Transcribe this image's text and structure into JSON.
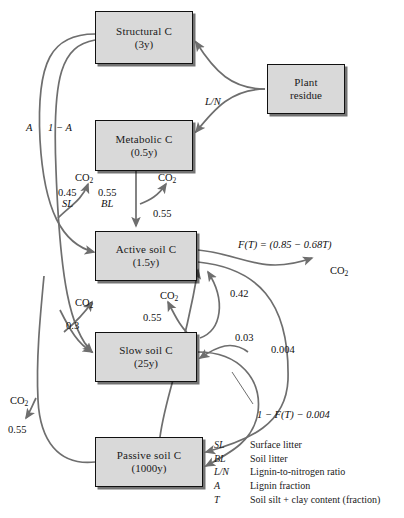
{
  "figure": {
    "type": "flow-diagram",
    "boxes": [
      {
        "id": "structural",
        "name": "Structural C",
        "turnover": "(3y)",
        "x": 95,
        "y": 11,
        "w": 98,
        "h": 53
      },
      {
        "id": "plant",
        "name": "Plant",
        "turnover": "residue",
        "x": 267,
        "y": 64,
        "w": 78,
        "h": 50
      },
      {
        "id": "metabolic",
        "name": "Metabolic C",
        "turnover": "(0.5y)",
        "x": 95,
        "y": 120,
        "w": 98,
        "h": 51
      },
      {
        "id": "active",
        "name": "Active soil C",
        "turnover": "(1.5y)",
        "x": 95,
        "y": 231,
        "w": 102,
        "h": 50
      },
      {
        "id": "slow",
        "name": "Slow soil C",
        "turnover": "(25y)",
        "x": 95,
        "y": 332,
        "w": 102,
        "h": 50
      },
      {
        "id": "passive",
        "name": "Passive soil C",
        "turnover": "(1000y)",
        "x": 95,
        "y": 437,
        "w": 108,
        "h": 50
      }
    ],
    "flow_labels": [
      {
        "id": "ln",
        "text": "L/N",
        "x": 205,
        "y": 96,
        "italic": true
      },
      {
        "id": "a-fraction",
        "text": "A",
        "x": 26,
        "y": 122,
        "italic": true
      },
      {
        "id": "one-minus-a",
        "text": "1 − A",
        "x": 48,
        "y": 122,
        "italic": true
      },
      {
        "id": "co2-structural",
        "text": "CO2",
        "x": 75,
        "y": 172,
        "italic": false
      },
      {
        "id": "frac-045",
        "text": "0.45",
        "x": 58,
        "y": 187,
        "italic": false
      },
      {
        "id": "frac-055-bl",
        "text": "0.55",
        "x": 98,
        "y": 187,
        "italic": false
      },
      {
        "id": "sl",
        "text": "SL",
        "x": 62,
        "y": 198,
        "italic": true
      },
      {
        "id": "bl",
        "text": "BL",
        "x": 101,
        "y": 198,
        "italic": true
      },
      {
        "id": "co2-metabolic",
        "text": "CO2",
        "x": 158,
        "y": 172,
        "italic": false
      },
      {
        "id": "frac-055-met",
        "text": "0.55",
        "x": 153,
        "y": 208,
        "italic": false
      },
      {
        "id": "ft-equation",
        "text": "F(T) = (0.85 − 0.68T)",
        "x": 238,
        "y": 239,
        "italic": true
      },
      {
        "id": "co2-active",
        "text": "CO2",
        "x": 330,
        "y": 265,
        "italic": false
      },
      {
        "id": "frac-042",
        "text": "0.42",
        "x": 230,
        "y": 288,
        "italic": false
      },
      {
        "id": "co2-slow-left",
        "text": "CO2",
        "x": 75,
        "y": 297,
        "italic": false
      },
      {
        "id": "frac-03",
        "text": "0.3",
        "x": 66,
        "y": 320,
        "italic": false
      },
      {
        "id": "co2-slow-mid",
        "text": "CO2",
        "x": 160,
        "y": 290,
        "italic": false
      },
      {
        "id": "frac-055-slow",
        "text": "0.55",
        "x": 143,
        "y": 312,
        "italic": false
      },
      {
        "id": "frac-003",
        "text": "0.03",
        "x": 235,
        "y": 332,
        "italic": false
      },
      {
        "id": "frac-0004",
        "text": "0.004",
        "x": 271,
        "y": 344,
        "italic": false
      },
      {
        "id": "one-minus-ft",
        "text": "1 − F(T) − 0.004",
        "x": 257,
        "y": 409,
        "italic": true
      },
      {
        "id": "co2-passive",
        "text": "CO2",
        "x": 10,
        "y": 395,
        "italic": false
      },
      {
        "id": "frac-055-pass",
        "text": "0.55",
        "x": 8,
        "y": 424,
        "italic": false
      }
    ],
    "legend": [
      {
        "symbol": "SL",
        "definition": "Surface litter"
      },
      {
        "symbol": "BL",
        "definition": "Soil litter"
      },
      {
        "symbol": "L/N",
        "definition": "Lignin-to-nitrogen ratio"
      },
      {
        "symbol": "A",
        "definition": "Lignin fraction"
      },
      {
        "symbol": "T",
        "definition": "Soil silt + clay content (fraction)"
      }
    ],
    "colors": {
      "box_fill": "#d9d9d9",
      "box_border": "#111111",
      "arrow": "#6e6e6e",
      "text": "#1a1a1a",
      "background": "#ffffff"
    }
  }
}
